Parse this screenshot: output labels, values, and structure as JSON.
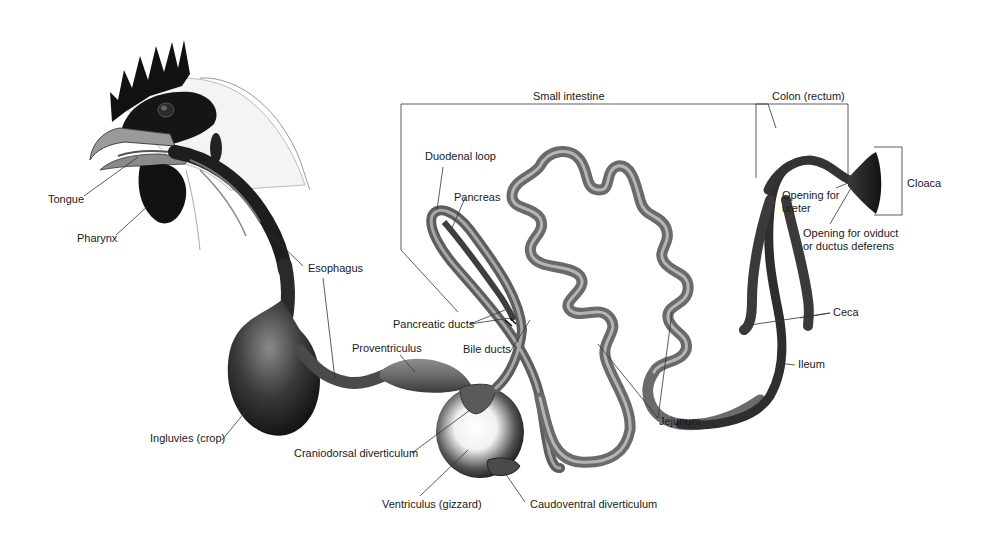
{
  "figure": {
    "colors": {
      "background": "#ffffff",
      "organ_dark": "#2a2a2a",
      "organ_mid": "#6e6e6e",
      "organ_light": "#b8b8b8",
      "leader_line": "#333333",
      "label_text": "#1a1a1a"
    }
  },
  "labels": {
    "tongue": "Tongue",
    "pharynx": "Pharynx",
    "esophagus": "Esophagus",
    "ingluvies": "Ingluvies (crop)",
    "proventriculus": "Proventriculus",
    "craniodorsal": "Craniodorsal diverticulum",
    "ventriculus": "Ventriculus (gizzard)",
    "caudoventral": "Caudoventral diverticulum",
    "small_intestine": "Small intestine",
    "duodenal_loop": "Duodenal loop",
    "pancreas": "Pancreas",
    "pancreatic_ducts": "Pancreatic ducts",
    "bile_ducts": "Bile ducts",
    "jejunum": "Jejunum",
    "colon": "Colon (rectum)",
    "cloaca": "Cloaca",
    "opening_ureter": "Opening for\nureter",
    "opening_oviduct": "Opening for oviduct\nor ductus deferens",
    "ceca": "Ceca",
    "ileum": "Ileum"
  }
}
